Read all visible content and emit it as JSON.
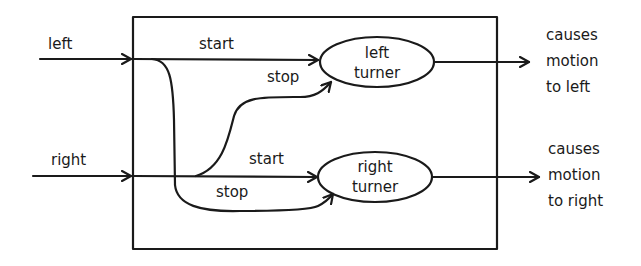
{
  "diagram": {
    "inputs": [
      {
        "id": "left",
        "label": "left"
      },
      {
        "id": "right",
        "label": "right"
      }
    ],
    "nodes": [
      {
        "id": "left-turner",
        "line1": "left",
        "line2": "turner"
      },
      {
        "id": "right-turner",
        "line1": "right",
        "line2": "turner"
      }
    ],
    "edges": [
      {
        "from": "left",
        "to": "left-turner",
        "label": "start"
      },
      {
        "from": "right",
        "to": "left-turner",
        "label": "stop"
      },
      {
        "from": "right",
        "to": "right-turner",
        "label": "start"
      },
      {
        "from": "left",
        "to": "right-turner",
        "label": "stop"
      }
    ],
    "outputs": [
      {
        "from": "left-turner",
        "line1": "causes",
        "line2": "motion",
        "line3": "to left"
      },
      {
        "from": "right-turner",
        "line1": "causes",
        "line2": "motion",
        "line3": "to right"
      }
    ]
  }
}
